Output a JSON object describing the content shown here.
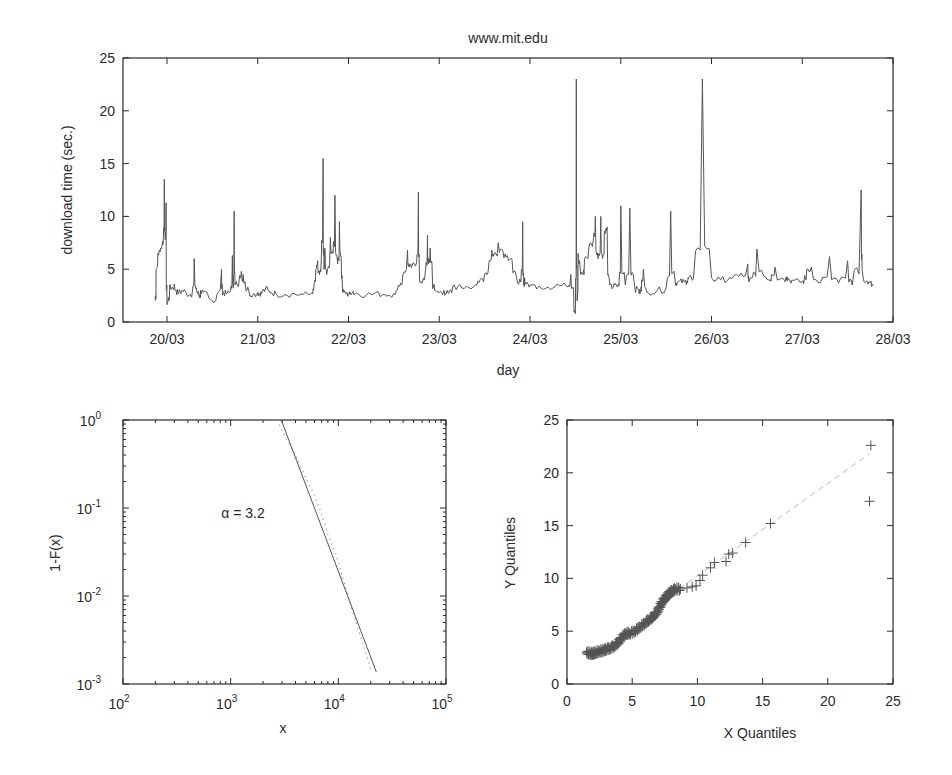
{
  "chart_data": [
    {
      "type": "line",
      "title": "www.mit.edu",
      "xlabel": "day",
      "ylabel": "download time (sec.)",
      "xticks": [
        "20/03",
        "21/03",
        "22/03",
        "23/03",
        "24/03",
        "25/03",
        "26/03",
        "27/03",
        "28/03"
      ],
      "yticks": [
        "0",
        "5",
        "10",
        "15",
        "20",
        "25"
      ],
      "ylim": [
        0,
        25
      ],
      "xlim_days": [
        19.515,
        28.0
      ],
      "grid": false,
      "series": [
        {
          "name": "download time",
          "x": [
            19.87,
            19.88,
            19.9,
            19.93,
            19.95,
            19.96,
            19.97,
            19.98,
            19.99,
            20.0,
            20.01,
            20.03,
            20.05,
            20.08,
            20.1,
            20.13,
            20.16,
            20.2,
            20.25,
            20.28,
            20.3,
            20.33,
            20.35,
            20.36,
            20.37,
            20.4,
            20.45,
            20.5,
            20.55,
            20.6,
            20.61,
            20.62,
            20.65,
            20.7,
            20.72,
            20.73,
            20.74,
            20.75,
            20.8,
            20.82,
            20.83,
            20.84,
            20.86,
            20.9,
            20.95,
            21.0,
            21.02,
            21.05,
            21.1,
            21.15,
            21.2,
            21.3,
            21.4,
            21.5,
            21.6,
            21.62,
            21.64,
            21.66,
            21.68,
            21.7,
            21.72,
            21.73,
            21.74,
            21.76,
            21.8,
            21.83,
            21.85,
            21.88,
            21.9,
            21.92,
            21.93,
            21.95,
            21.98,
            22.0,
            22.02,
            22.05,
            22.1,
            22.2,
            22.3,
            22.4,
            22.5,
            22.55,
            22.6,
            22.65,
            22.67,
            22.7,
            22.75,
            22.77,
            22.78,
            22.8,
            22.85,
            22.87,
            22.88,
            22.9,
            22.92,
            22.95,
            23.0,
            23.05,
            23.1,
            23.15,
            23.2,
            23.3,
            23.4,
            23.45,
            23.5,
            23.55,
            23.58,
            23.6,
            23.65,
            23.7,
            23.75,
            23.8,
            23.85,
            23.9,
            23.92,
            23.93,
            23.94,
            23.96,
            24.0,
            24.1,
            24.2,
            24.3,
            24.4,
            24.45,
            24.48,
            24.5,
            24.51,
            24.52,
            24.53,
            24.55,
            24.58,
            24.6,
            24.65,
            24.7,
            24.72,
            24.75,
            24.78,
            24.8,
            24.82,
            24.85,
            24.88,
            24.9,
            24.92,
            24.95,
            24.98,
            25.0,
            25.05,
            25.1,
            25.15,
            25.2,
            25.21,
            25.22,
            25.23,
            25.25,
            25.3,
            25.4,
            25.5,
            25.55,
            25.6,
            25.62,
            25.65,
            25.7,
            25.73,
            25.74,
            25.75,
            25.8,
            25.9,
            26.0,
            26.1,
            26.2,
            26.3,
            26.4,
            26.41,
            26.42,
            26.45,
            26.5,
            26.6,
            26.65,
            26.66,
            26.7,
            26.8,
            26.82,
            26.83,
            26.85,
            26.9,
            27.0,
            27.02,
            27.05,
            27.1,
            27.2,
            27.3,
            27.4,
            27.5,
            27.55,
            27.65,
            27.66,
            27.7,
            27.75,
            27.78,
            27.8,
            27.81,
            27.85,
            27.88,
            27.89,
            27.9,
            27.95,
            28.0
          ],
          "y": [
            2.0,
            5.0,
            6.5,
            7.0,
            7.5,
            8.0,
            13.5,
            7.8,
            11.3,
            1.8,
            2.0,
            3.5,
            3.2,
            3.6,
            3.0,
            2.8,
            3.0,
            2.9,
            2.6,
            2.9,
            6.0,
            2.8,
            2.7,
            2.4,
            3.0,
            2.8,
            2.6,
            2.0,
            2.6,
            5.0,
            3.0,
            2.8,
            2.7,
            2.9,
            6.3,
            3.2,
            10.5,
            3.5,
            4.4,
            4.8,
            4.0,
            4.5,
            3.8,
            3.0,
            2.6,
            2.8,
            2.7,
            2.9,
            3.4,
            2.8,
            2.7,
            2.6,
            2.7,
            2.6,
            2.8,
            3.5,
            5.0,
            5.8,
            4.5,
            6.0,
            15.5,
            5.0,
            7.0,
            4.5,
            8.0,
            6.5,
            12.0,
            5.5,
            9.5,
            6.0,
            4.0,
            2.8,
            2.7,
            2.6,
            2.8,
            2.9,
            2.7,
            2.6,
            2.8,
            2.6,
            2.7,
            3.5,
            4.5,
            6.8,
            5.2,
            5.3,
            5.6,
            12.3,
            5.0,
            3.7,
            5.0,
            8.2,
            5.5,
            7.0,
            5.5,
            3.0,
            2.8,
            3.0,
            2.7,
            3.4,
            3.3,
            3.4,
            3.5,
            4.0,
            4.5,
            5.8,
            6.8,
            6.3,
            7.5,
            6.8,
            6.3,
            6.0,
            4.3,
            3.8,
            9.5,
            3.5,
            4.2,
            3.6,
            3.5,
            3.4,
            3.3,
            3.6,
            3.4,
            4.5,
            3.2,
            0.8,
            23.0,
            2.0,
            6.5,
            5.5,
            4.5,
            6.0,
            7.2,
            8.0,
            10.0,
            6.0,
            10.0,
            6.0,
            8.6,
            9.0,
            3.5,
            3.3,
            3.4,
            3.5,
            3.4,
            11.0,
            3.5,
            10.8,
            3.6,
            3.0,
            2.8,
            3.0,
            4.0,
            5.0,
            2.8,
            3.0,
            3.2,
            10.5,
            3.8,
            3.7,
            3.9,
            3.8,
            3.9,
            4.0,
            4.2,
            4.1,
            23.0,
            4.2,
            4.0,
            4.2,
            4.3,
            5.5,
            3.9,
            4.0,
            4.2,
            6.9,
            4.2,
            4.0,
            4.5,
            5.2,
            4.0,
            4.2,
            4.3,
            4.1,
            3.9,
            3.8,
            4.0,
            5.0,
            5.2,
            3.7,
            6.2,
            3.7,
            5.8,
            3.5,
            12.5,
            5.0,
            3.8,
            3.7,
            3.6
          ]
        }
      ]
    },
    {
      "type": "line",
      "title": "",
      "xlabel": "x",
      "ylabel": "1-F(x)",
      "xscale": "log",
      "yscale": "log",
      "xlim": [
        100,
        100000
      ],
      "ylim": [
        0.001,
        1
      ],
      "xticks": [
        "10^2",
        "10^3",
        "10^4",
        "10^5"
      ],
      "yticks": [
        "10^0",
        "10^-1",
        "10^-2",
        "10^-3"
      ],
      "annotation": "α = 3.2",
      "grid": false,
      "series": [
        {
          "name": "fitted power law (solid)",
          "x": [
            2950,
            22500
          ],
          "y": [
            1.0,
            0.00137
          ]
        },
        {
          "name": "empirical CCDF (dotted)",
          "x": [
            2700,
            3300,
            4000,
            5000,
            6000,
            7000,
            8000,
            9500,
            11000,
            13000,
            15000,
            17500,
            20000
          ],
          "y": [
            1.0,
            0.6,
            0.4,
            0.22,
            0.14,
            0.085,
            0.05,
            0.03,
            0.016,
            0.008,
            0.0045,
            0.0025,
            0.0015
          ]
        }
      ]
    },
    {
      "type": "scatter",
      "title": "",
      "xlabel": "X Quantiles",
      "ylabel": "Y Quantiles",
      "xlim": [
        0,
        25
      ],
      "ylim": [
        0,
        25
      ],
      "xticks": [
        "0",
        "5",
        "10",
        "15",
        "20",
        "25"
      ],
      "yticks": [
        "0",
        "5",
        "10",
        "15",
        "20",
        "25"
      ],
      "marker": "+",
      "grid": false,
      "series": [
        {
          "name": "quantile points",
          "x": [
            1.5,
            1.8,
            2.0,
            2.2,
            2.5,
            2.8,
            3.0,
            3.3,
            3.6,
            3.9,
            4.2,
            4.5,
            4.8,
            5.2,
            5.6,
            6.0,
            6.3,
            6.6,
            6.9,
            7.1,
            7.3,
            7.5,
            7.7,
            7.9,
            8.1,
            8.3,
            8.7,
            9.2,
            9.6,
            9.9,
            10.2,
            10.4,
            11.0,
            11.3,
            12.2,
            12.4,
            12.7,
            13.7,
            15.6,
            23.2,
            23.3
          ],
          "y": [
            3.0,
            2.9,
            2.9,
            3.0,
            3.1,
            3.2,
            3.3,
            3.4,
            3.6,
            3.9,
            4.4,
            4.8,
            4.8,
            5.0,
            5.4,
            5.8,
            6.1,
            6.4,
            6.8,
            7.3,
            7.8,
            8.1,
            8.4,
            8.7,
            8.8,
            9.0,
            9.0,
            9.1,
            9.2,
            9.3,
            9.8,
            10.3,
            11.0,
            11.5,
            11.6,
            12.3,
            12.4,
            13.4,
            15.2,
            17.3,
            22.6
          ]
        },
        {
          "name": "reference line (dashed)",
          "x": [
            8.0,
            23.2
          ],
          "y": [
            8.5,
            21.8
          ]
        }
      ]
    }
  ],
  "ui": {
    "top": {
      "title": "www.mit.edu",
      "xlabel": "day",
      "ylabel": "download time (sec.)",
      "xticks": [
        "20/03",
        "21/03",
        "22/03",
        "23/03",
        "24/03",
        "25/03",
        "26/03",
        "27/03",
        "28/03"
      ],
      "yticks": [
        "0",
        "5",
        "10",
        "15",
        "20",
        "25"
      ]
    },
    "loglog": {
      "xlabel": "x",
      "ylabel": "1-F(x)",
      "annotation": "α = 3.2",
      "xtick_base": "10",
      "xtick_exps": [
        "2",
        "3",
        "4",
        "5"
      ],
      "ytick_exps": [
        "0",
        "-1",
        "-2",
        "-3"
      ]
    },
    "qq": {
      "xlabel": "X Quantiles",
      "ylabel": "Y Quantiles",
      "xticks": [
        "0",
        "5",
        "10",
        "15",
        "20",
        "25"
      ],
      "yticks": [
        "0",
        "5",
        "10",
        "15",
        "20",
        "25"
      ]
    },
    "colors": {
      "axis": "#2a2a2a",
      "line": "#555555",
      "dotted": "#999999",
      "dashed": "#cfcfcf"
    }
  }
}
